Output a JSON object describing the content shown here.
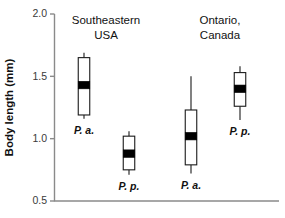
{
  "chart_data": {
    "type": "box",
    "title": "",
    "xlabel": "",
    "ylabel": "Body length (mm)",
    "ylim": [
      0.5,
      2.0
    ],
    "yticks": [
      "2.0",
      "1.5",
      "1.0",
      "0.5"
    ],
    "ytick_values": [
      2.0,
      1.5,
      1.0,
      0.5
    ],
    "grid": false,
    "legend": "none",
    "groups": [
      {
        "name": "Southeastern USA",
        "label_lines": [
          "Southeastern",
          "USA"
        ]
      },
      {
        "name": "Ontario, Canada",
        "label_lines": [
          "Ontario,",
          "Canada"
        ]
      }
    ],
    "boxes": [
      {
        "id": "se-usa-pa",
        "group": "Southeastern USA",
        "series_label": "P. a.",
        "label_position": "below",
        "whisker_low": 1.16,
        "box_low": 1.19,
        "median": 1.43,
        "box_high": 1.65,
        "whisker_high": 1.69
      },
      {
        "id": "se-usa-pp",
        "group": "Southeastern USA",
        "series_label": "P. p.",
        "label_position": "below",
        "whisker_low": 0.71,
        "box_low": 0.75,
        "median": 0.88,
        "box_high": 1.02,
        "whisker_high": 1.06
      },
      {
        "id": "ontario-pa",
        "group": "Ontario, Canada",
        "series_label": "P. a.",
        "label_position": "below",
        "whisker_low": 0.72,
        "box_low": 0.79,
        "median": 1.02,
        "box_high": 1.23,
        "whisker_high": 1.5
      },
      {
        "id": "ontario-pp",
        "group": "Ontario, Canada",
        "series_label": "P. p.",
        "label_position": "below",
        "whisker_low": 1.15,
        "box_low": 1.26,
        "median": 1.4,
        "box_high": 1.53,
        "whisker_high": 1.58
      }
    ],
    "colors": {
      "background": "#ffffff",
      "axis": "#8a8a8a",
      "box_stroke": "#1a1a1a",
      "box_fill": "#ffffff",
      "median_fill": "#000000",
      "text": "#111111",
      "tick_text": "#3a3a3a"
    }
  }
}
